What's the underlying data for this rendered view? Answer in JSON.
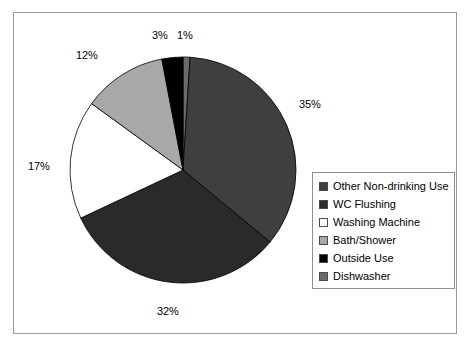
{
  "chart_data": {
    "type": "pie",
    "title": "",
    "labels": [
      "Other Non-drinking Use",
      "WC Flushing",
      "Washing Machine",
      "Bath/Shower",
      "Outside Use",
      "Dishwasher"
    ],
    "values": [
      35,
      32,
      17,
      12,
      3,
      1
    ],
    "value_labels": [
      "35%",
      "32%",
      "17%",
      "12%",
      "3%",
      "1%"
    ],
    "colors": [
      "#3f3f3f",
      "#2a2a2a",
      "#ffffff",
      "#a8a8a8",
      "#000000",
      "#6a6a6a"
    ],
    "start_angle_deg": 0,
    "direction": "clockwise",
    "legend_position": "right",
    "grid": false,
    "slices": [
      {
        "label": "Dishwasher",
        "value": 1,
        "value_label": "1%",
        "color": "#6a6a6a"
      },
      {
        "label": "Other Non-drinking Use",
        "value": 35,
        "value_label": "35%",
        "color": "#3f3f3f"
      },
      {
        "label": "WC Flushing",
        "value": 32,
        "value_label": "32%",
        "color": "#2a2a2a"
      },
      {
        "label": "Washing Machine",
        "value": 17,
        "value_label": "17%",
        "color": "#ffffff"
      },
      {
        "label": "Bath/Shower",
        "value": 12,
        "value_label": "12%",
        "color": "#a8a8a8"
      },
      {
        "label": "Outside Use",
        "value": 3,
        "value_label": "3%",
        "color": "#000000"
      }
    ]
  },
  "legend": {
    "items": [
      {
        "label": "Other Non-drinking Use",
        "color": "#3f3f3f"
      },
      {
        "label": "WC Flushing",
        "color": "#2a2a2a"
      },
      {
        "label": "Washing Machine",
        "color": "#ffffff"
      },
      {
        "label": "Bath/Shower",
        "color": "#a8a8a8"
      },
      {
        "label": "Outside Use",
        "color": "#000000"
      },
      {
        "label": "Dishwasher",
        "color": "#6a6a6a"
      }
    ]
  },
  "labels_on_chart": [
    {
      "text": "35%",
      "x": 299,
      "y": 98
    },
    {
      "text": "32%",
      "x": 157,
      "y": 305
    },
    {
      "text": "17%",
      "x": 28,
      "y": 160
    },
    {
      "text": "12%",
      "x": 76,
      "y": 49
    },
    {
      "text": "3%",
      "x": 152,
      "y": 29
    },
    {
      "text": "1%",
      "x": 177,
      "y": 29
    }
  ],
  "frame": {
    "border_color": "#9a9a9a"
  }
}
